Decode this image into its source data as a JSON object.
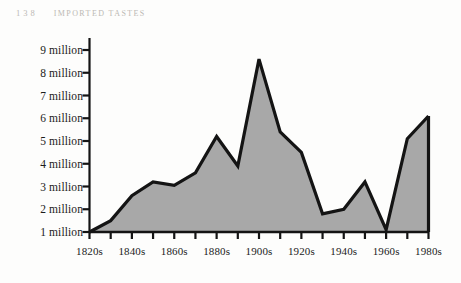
{
  "page": {
    "folio": "138",
    "running_head": "Imported Tastes",
    "paper_color": "#fdfdfc",
    "ink_color": "#1b1b1b",
    "runhead_color": "#b9b6b1"
  },
  "chart_data": {
    "type": "area",
    "title": "",
    "xlabel": "",
    "ylabel": "",
    "grid": false,
    "legend": null,
    "fill_color": "#a8a8a8",
    "line_color": "#141414",
    "ylim": [
      1,
      9
    ],
    "y_ticks": [
      1,
      2,
      3,
      4,
      5,
      6,
      7,
      8,
      9
    ],
    "y_tick_labels": [
      "1 million",
      "2 million",
      "3 million",
      "4 million",
      "5 million",
      "6 million",
      "7 million",
      "8 million",
      "9 million"
    ],
    "x_tick_labels": [
      "1820s",
      "1840s",
      "1860s",
      "1880s",
      "1900s",
      "1920s",
      "1940s",
      "1960s",
      "1980s"
    ],
    "categories": [
      "1820s",
      "1830s",
      "1840s",
      "1850s",
      "1860s",
      "1870s",
      "1880s",
      "1890s",
      "1900s",
      "1910s",
      "1920s",
      "1930s",
      "1940s",
      "1950s",
      "1960s",
      "1970s",
      "1980s"
    ],
    "values": [
      1.0,
      1.5,
      2.6,
      3.2,
      3.05,
      3.6,
      5.2,
      3.9,
      8.6,
      5.4,
      4.5,
      1.8,
      2.0,
      3.2,
      1.1,
      5.1,
      6.1
    ]
  }
}
